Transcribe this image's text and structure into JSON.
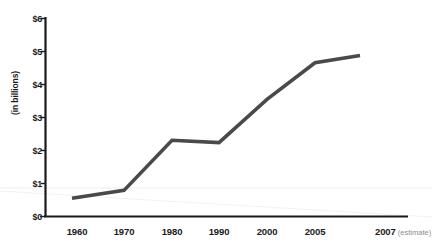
{
  "chart_data": {
    "type": "line",
    "title": "",
    "subtitle": "",
    "xlabel": "",
    "ylabel": "(in billions)",
    "categories": [
      "1960",
      "1970",
      "1980",
      "1990",
      "2000",
      "2005",
      "2007"
    ],
    "x_tick_labels": [
      "1960",
      "1970",
      "1980",
      "1990",
      "2000",
      "2005",
      "2007"
    ],
    "x_tick_note": "(estimate)",
    "x_tick_note_index": 6,
    "values": [
      0.55,
      0.79,
      2.31,
      2.24,
      3.55,
      4.66,
      4.88
    ],
    "series": [
      {
        "name": "",
        "values": [
          0.55,
          0.79,
          2.31,
          2.24,
          3.55,
          4.66,
          4.88
        ]
      }
    ],
    "y_tick_labels": [
      "$0",
      "$1",
      "$2",
      "$3",
      "$4",
      "$5",
      "$6"
    ],
    "y_tick_values": [
      0,
      1,
      2,
      3,
      4,
      5,
      6
    ],
    "ylim": [
      0,
      6
    ],
    "grid": false,
    "legend": "none",
    "line_color": "#4a4a4a",
    "axis_color": "#1a1a1a",
    "text_color": "#1a1a1a",
    "note_color": "#8d8d8d",
    "background_color": "#ffffff"
  }
}
